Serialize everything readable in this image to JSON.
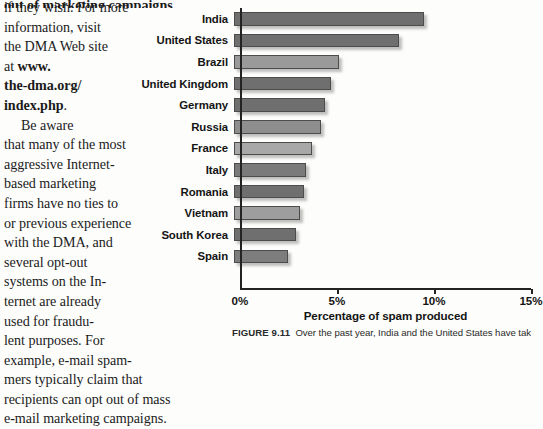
{
  "body_text": {
    "clipped_top_line": "out of marketing campaigns",
    "lines": [
      {
        "text": "if they wish. For more",
        "indent": false,
        "bold": false
      },
      {
        "text": "information, visit",
        "indent": false,
        "bold": false
      },
      {
        "text": "the DMA Web site",
        "indent": false,
        "bold": false
      },
      {
        "text": "at www.",
        "indent": false,
        "bold": "partial-at"
      },
      {
        "text": "the-dma.org/",
        "indent": false,
        "bold": true
      },
      {
        "text": "index.php.",
        "indent": false,
        "bold": "partial-period"
      },
      {
        "text": "Be aware",
        "indent": true,
        "bold": false
      },
      {
        "text": "that many of the most",
        "indent": false,
        "bold": false
      },
      {
        "text": "aggressive Internet-",
        "indent": false,
        "bold": false
      },
      {
        "text": "based marketing",
        "indent": false,
        "bold": false
      },
      {
        "text": "firms have no ties to",
        "indent": false,
        "bold": false
      },
      {
        "text": "or previous experience",
        "indent": false,
        "bold": false
      },
      {
        "text": "with the DMA, and",
        "indent": false,
        "bold": false
      },
      {
        "text": "several opt-out",
        "indent": false,
        "bold": false
      },
      {
        "text": "systems on the In-",
        "indent": false,
        "bold": false
      },
      {
        "text": "ternet are already",
        "indent": false,
        "bold": false
      },
      {
        "text": "used for fraudu-",
        "indent": false,
        "bold": false
      },
      {
        "text": "lent purposes. For",
        "indent": false,
        "bold": false
      },
      {
        "text": "example, e-mail spam-",
        "indent": false,
        "bold": false
      },
      {
        "text": "mers typically claim that",
        "indent": false,
        "bold": false
      },
      {
        "text": "recipients can opt out of mass",
        "indent": false,
        "bold": false
      },
      {
        "text": "e-mail marketing campaigns.",
        "indent": false,
        "bold": false
      }
    ]
  },
  "caption": {
    "figure_number": "FIGURE 9.11",
    "text": "Over the past year, India and the United States have taken"
  },
  "chart_data": {
    "type": "bar",
    "orientation": "horizontal",
    "title": "",
    "xlabel": "Percentage of spam produced",
    "ylabel": "",
    "categories": [
      "India",
      "United States",
      "Brazil",
      "United Kingdom",
      "Germany",
      "Russia",
      "France",
      "Italy",
      "Romania",
      "Vietnam",
      "South Korea",
      "Spain"
    ],
    "values": [
      9.8,
      8.5,
      5.4,
      5.0,
      4.7,
      4.5,
      4.0,
      3.7,
      3.6,
      3.4,
      3.2,
      2.8
    ],
    "bar_colors": [
      "#6f6f6f",
      "#6f6f6f",
      "#9a9a9a",
      "#6f6f6f",
      "#6f6f6f",
      "#8e8e8e",
      "#a8a8a8",
      "#7a7a7a",
      "#6f6f6f",
      "#9e9e9e",
      "#6f6f6f",
      "#7d7d7d"
    ],
    "xlim": [
      0,
      15
    ],
    "xticks": [
      0,
      5,
      10,
      15
    ],
    "xticklabels": [
      "0%",
      "5%",
      "10%",
      "15%"
    ],
    "grid": false,
    "legend": null
  },
  "colors": {
    "axis": "#232323",
    "text": "#141414",
    "page_background": "#fdfdfb"
  }
}
